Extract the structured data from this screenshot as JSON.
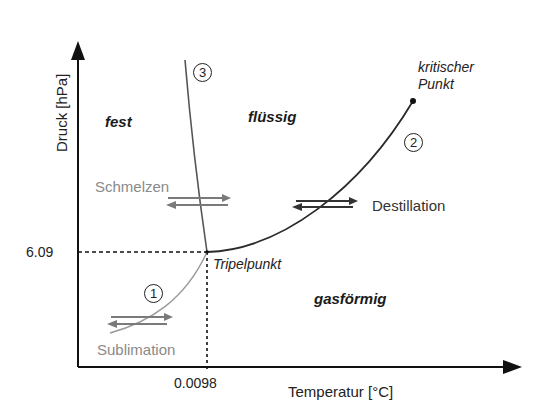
{
  "diagram": {
    "type": "phase-diagram",
    "axes": {
      "x_label": "Temperatur [°C]",
      "y_label": "Druck [hPa]",
      "x_tick": "0.0098",
      "y_tick": "6.09"
    },
    "phases": {
      "solid": "fest",
      "liquid": "flüssig",
      "gas": "gasförmig"
    },
    "points": {
      "triple_point": "Tripelpunkt",
      "critical_point_line1": "kritischer",
      "critical_point_line2": "Punkt"
    },
    "curves": {
      "sublimation_number": "1",
      "vaporization_number": "2",
      "melting_number": "3"
    },
    "processes": {
      "melting": "Schmelzen",
      "distillation": "Destillation",
      "sublimation": "Sublimation"
    },
    "colors": {
      "axis": "#111111",
      "vapor_curve": "#2a2a2a",
      "melt_curve": "#555555",
      "sublimation_curve": "#9a9a9a",
      "gray_text": "#8a8a8a",
      "arrows_gray": "#7a7a7a",
      "arrows_dark": "#333333"
    }
  }
}
